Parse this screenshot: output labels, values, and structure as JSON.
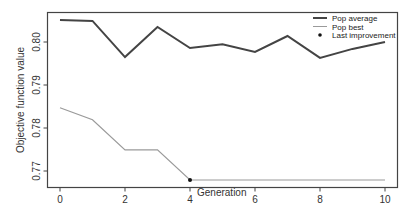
{
  "chart_data": {
    "type": "line",
    "title": "",
    "xlabel": "Generation",
    "ylabel": "Objective function value",
    "x": [
      0,
      1,
      2,
      3,
      4,
      5,
      6,
      7,
      8,
      9,
      10
    ],
    "x_ticks": [
      0,
      2,
      4,
      6,
      8,
      10
    ],
    "y_ticks": [
      0.77,
      0.78,
      0.79,
      0.8
    ],
    "y_tick_labels": [
      "0.77",
      "0.78",
      "0.79",
      "0.80"
    ],
    "x_tick_labels": [
      "0",
      "2",
      "4",
      "6",
      "8",
      "10"
    ],
    "xlim": [
      -0.4,
      10.4
    ],
    "ylim": [
      0.7662,
      0.807
    ],
    "grid": false,
    "legend_position": "top-right",
    "series": [
      {
        "name": "Pop average",
        "color": "#444444",
        "line_width": 2,
        "values": [
          0.8051,
          0.8049,
          0.7965,
          0.8035,
          0.7986,
          0.7995,
          0.7977,
          0.8014,
          0.7963,
          0.7984,
          0.8
        ]
      },
      {
        "name": "Pop best",
        "color": "#9a9a9a",
        "line_width": 1.2,
        "values": [
          0.7847,
          0.7819,
          0.7749,
          0.7749,
          0.7679,
          0.7679,
          0.7679,
          0.7679,
          0.7679,
          0.7679,
          0.7679
        ]
      }
    ],
    "annotations": [
      {
        "name": "Last improvement",
        "type": "point",
        "x": 4,
        "y": 0.7679,
        "color": "#111111"
      }
    ]
  },
  "legend": {
    "items": [
      {
        "label": "Pop average",
        "glyph": "thick-line"
      },
      {
        "label": "Pop best",
        "glyph": "thin-line"
      },
      {
        "label": "Last improvement",
        "glyph": "dot"
      }
    ]
  }
}
